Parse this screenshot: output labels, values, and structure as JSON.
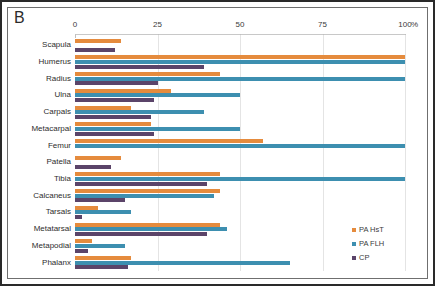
{
  "panel_label": "B",
  "axis": {
    "ticks": [
      0,
      25,
      50,
      75,
      100
    ],
    "unit_label": "%",
    "min": 0,
    "max": 100
  },
  "legend": {
    "position": "bottom-right",
    "entries": [
      {
        "label": "PA HsT",
        "color": "#e58b3d"
      },
      {
        "label": "PA FLH",
        "color": "#3d8fb0"
      },
      {
        "label": "CP",
        "color": "#5b4469"
      }
    ]
  },
  "chart_data": {
    "type": "bar",
    "orientation": "horizontal",
    "title": "B",
    "xlabel": "%",
    "ylabel": "",
    "xlim": [
      0,
      100
    ],
    "grid": true,
    "legend_position": "bottom-right",
    "categories": [
      "Scapula",
      "Humerus",
      "Radius",
      "Ulna",
      "Carpals",
      "Metacarpal",
      "Femur",
      "Patella",
      "Tibia",
      "Calcaneus",
      "Tarsals",
      "Metatarsal",
      "Metapodial",
      "Phalanx"
    ],
    "series": [
      {
        "name": "PA HsT",
        "color": "#e58b3d",
        "values": [
          14,
          100,
          44,
          29,
          17,
          23,
          57,
          14,
          44,
          44,
          7,
          44,
          5,
          17
        ]
      },
      {
        "name": "PA FLH",
        "color": "#3d8fb0",
        "values": [
          0,
          100,
          100,
          50,
          39,
          50,
          100,
          0,
          100,
          42,
          17,
          46,
          15,
          65
        ]
      },
      {
        "name": "CP",
        "color": "#5b4469",
        "values": [
          12,
          39,
          25,
          24,
          23,
          24,
          0,
          11,
          40,
          15,
          2,
          40,
          4,
          16
        ]
      }
    ]
  }
}
